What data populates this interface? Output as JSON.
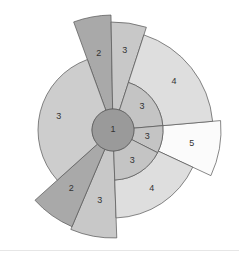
{
  "diagram": {
    "type": "sunburst",
    "center": {
      "x": 113,
      "y": 130
    },
    "core": {
      "label": "1",
      "radius": 21,
      "color": "#9a9a9a"
    },
    "sectors": [
      {
        "id": "top-2",
        "label": "2",
        "level": 2,
        "start": -20,
        "end": -1,
        "inner": 21,
        "outer": 115,
        "color": "#a9a9a9",
        "labelR": 78
      },
      {
        "id": "top-3",
        "label": "3",
        "level": 3,
        "start": -1,
        "end": 18,
        "inner": 21,
        "outer": 108,
        "color": "#c8c8c8",
        "labelR": 80
      },
      {
        "id": "right-4",
        "label": "4",
        "level": 4,
        "start": 18,
        "end": 85,
        "inner": 50,
        "outer": 100,
        "color": "#dedede",
        "labelR": 78
      },
      {
        "id": "inner-3a",
        "label": "3",
        "level": 3,
        "start": 18,
        "end": 85,
        "inner": 21,
        "outer": 50,
        "color": "#c4c4c4",
        "labelR": 37
      },
      {
        "id": "right-5",
        "label": "5",
        "level": 5,
        "start": 85,
        "end": 115,
        "inner": 50,
        "outer": 108,
        "color": "#fbfbfb",
        "labelR": 80
      },
      {
        "id": "inner-3b",
        "label": "3",
        "level": 3,
        "start": 85,
        "end": 117,
        "inner": 21,
        "outer": 50,
        "color": "#c4c4c4",
        "labelR": 35
      },
      {
        "id": "lower-4",
        "label": "4",
        "level": 4,
        "start": 115,
        "end": 178,
        "inner": 50,
        "outer": 88,
        "color": "#dedede",
        "labelR": 70
      },
      {
        "id": "inner-3c",
        "label": "3",
        "level": 3,
        "start": 117,
        "end": 178,
        "inner": 21,
        "outer": 50,
        "color": "#c4c4c4",
        "labelR": 36
      },
      {
        "id": "lower-3",
        "label": "3",
        "level": 3,
        "start": 178,
        "end": 203,
        "inner": 21,
        "outer": 108,
        "color": "#c8c8c8",
        "labelR": 72
      },
      {
        "id": "lower-2",
        "label": "2",
        "level": 2,
        "start": 203,
        "end": 228,
        "inner": 21,
        "outer": 105,
        "color": "#a9a9a9",
        "labelR": 72
      },
      {
        "id": "left-3",
        "label": "3",
        "level": 3,
        "start": 228,
        "end": 340,
        "inner": 21,
        "outer": 75,
        "color": "#cdcdcd",
        "labelR": 56
      }
    ]
  }
}
